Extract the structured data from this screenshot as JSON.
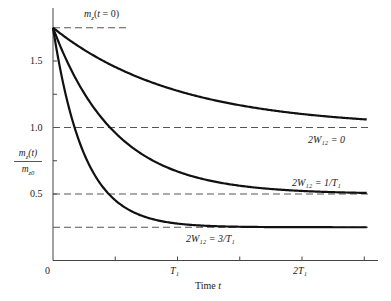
{
  "chart_data": {
    "type": "line",
    "title": "",
    "xlabel": "Time t",
    "ylabel": "m_z(t) / m_z0",
    "x_ticks": [
      {
        "pos": 0,
        "label": "0"
      },
      {
        "pos": 1,
        "label": "T1"
      },
      {
        "pos": 2,
        "label": "2T1"
      }
    ],
    "x_minor_ticks": [
      0.5,
      1.5,
      2.5
    ],
    "y_ticks": [
      {
        "pos": 0.5,
        "label": "0.5"
      },
      {
        "pos": 1.0,
        "label": "1.0"
      },
      {
        "pos": 1.5,
        "label": "1.5"
      }
    ],
    "y_minor_ticks": [
      0.75,
      1.25
    ],
    "xlim": [
      0,
      2.6
    ],
    "ylim": [
      0,
      1.85
    ],
    "initial_value": 1.75,
    "reference_lines": [
      {
        "y": 1.75,
        "label": "m_z(t = 0)",
        "x_end": 0.6
      },
      {
        "y": 1.0,
        "label": ""
      },
      {
        "y": 0.5,
        "label": ""
      },
      {
        "y": 0.25,
        "label": ""
      }
    ],
    "series": [
      {
        "name": "2W12 = 0",
        "asymptote": 1.0,
        "rate": 1.0,
        "x": [
          0,
          0.25,
          0.5,
          1.0,
          1.5,
          2.0,
          2.5
        ],
        "values": [
          1.75,
          1.58,
          1.45,
          1.28,
          1.17,
          1.1,
          1.06
        ]
      },
      {
        "name": "2W12 = 1/T1",
        "asymptote": 0.5,
        "rate": 2.0,
        "x": [
          0,
          0.25,
          0.5,
          1.0,
          1.5,
          2.0,
          2.5
        ],
        "values": [
          1.75,
          1.26,
          0.96,
          0.67,
          0.56,
          0.52,
          0.51
        ]
      },
      {
        "name": "2W12 = 3/T1",
        "asymptote": 0.25,
        "rate": 4.0,
        "x": [
          0,
          0.25,
          0.5,
          1.0,
          1.5,
          2.0,
          2.5
        ],
        "values": [
          1.75,
          0.8,
          0.45,
          0.28,
          0.25,
          0.25,
          0.25
        ]
      }
    ],
    "grid": false,
    "legend": "inline labels near curve ends"
  },
  "labels": {
    "mz0_label": "m",
    "mz0_sub": "z",
    "mz0_rest": "(t = 0)",
    "y_num": "m₂(t)",
    "y_den": "m₂₀",
    "y_num_text": "mz(t)",
    "y_den_text": "mz0",
    "curve1": "2W₁₂ = 0",
    "curve2": "2W₁₂ = 1/T₁",
    "curve3": "2W₁₂ = 3/T₁",
    "x_title": "Time t",
    "tick_0": "0",
    "tick_T1": "T₁",
    "tick_2T1": "2T₁",
    "tick_05": "0.5",
    "tick_10": "1.0",
    "tick_15": "1.5"
  }
}
